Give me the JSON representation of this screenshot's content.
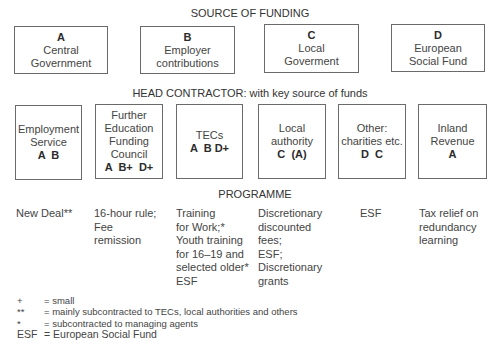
{
  "sections": {
    "source_title": "SOURCE OF FUNDING",
    "contractor_title": "HEAD CONTRACTOR: with key source of funds",
    "programme_title": "PROGRAMME"
  },
  "sources": [
    {
      "code": "A",
      "label": "Central\nGovernment"
    },
    {
      "code": "B",
      "label": "Employer\ncontributions"
    },
    {
      "code": "C",
      "label": "Local\nGoverment"
    },
    {
      "code": "D",
      "label": "European\nSocial Fund"
    }
  ],
  "contractors": [
    {
      "label": "Employment\nService",
      "codes": "A  B"
    },
    {
      "label": "Further\nEducation\nFunding\nCouncil",
      "codes": "A  B+  D+"
    },
    {
      "label": "TECs",
      "codes": "A  B D+"
    },
    {
      "label": "Local\nauthority",
      "codes": "C  (A)"
    },
    {
      "label": "Other:\ncharities etc.",
      "codes": "D  C"
    },
    {
      "label": "Inland\nRevenue",
      "codes": "A"
    }
  ],
  "programmes": [
    "New Deal**",
    "16-hour rule;\nFee\nremission",
    "Training\nfor Work;*\nYouth training\nfor 16–19 and\nselected older*\nESF",
    "Discretionary\ndiscounted\nfees;\nESF;\nDiscretionary\ngrants",
    "ESF",
    "Tax relief on\nredundancy\nlearning"
  ],
  "legend": [
    {
      "symbol": "+",
      "meaning": "= small"
    },
    {
      "symbol": "**",
      "meaning": "= mainly subcontracted to TECs, local authorities and others"
    },
    {
      "symbol": "*",
      "meaning": "= subcontracted to managing agents"
    },
    {
      "symbol": "ESF",
      "meaning": "= European Social Fund"
    }
  ]
}
